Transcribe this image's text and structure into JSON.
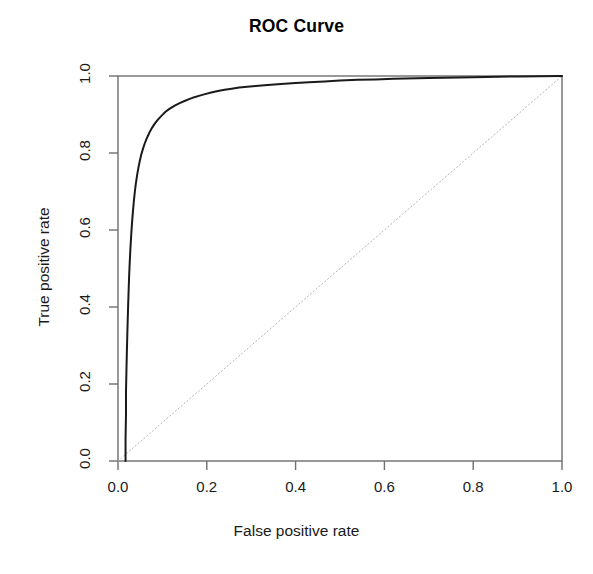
{
  "chart_data": {
    "type": "line",
    "title": "ROC Curve",
    "xlabel": "False positive rate",
    "ylabel": "True positive rate",
    "xlim": [
      0.0,
      1.0
    ],
    "ylim": [
      0.0,
      1.0
    ],
    "grid": false,
    "legend": "none",
    "xticks": [
      "0.0",
      "0.2",
      "0.4",
      "0.6",
      "0.8",
      "1.0"
    ],
    "xtick_values": [
      0.0,
      0.2,
      0.4,
      0.6,
      0.8,
      1.0
    ],
    "yticks": [
      "0.0",
      "0.2",
      "0.4",
      "0.6",
      "0.8",
      "1.0"
    ],
    "ytick_values": [
      0.0,
      0.2,
      0.4,
      0.6,
      0.8,
      1.0
    ],
    "series": [
      {
        "name": "ROC curve",
        "color": "#1a1a1a",
        "style": "solid",
        "width": 2,
        "x": [
          0.017,
          0.017,
          0.018,
          0.018,
          0.019,
          0.02,
          0.021,
          0.022,
          0.023,
          0.024,
          0.025,
          0.026,
          0.027,
          0.028,
          0.03,
          0.032,
          0.034,
          0.036,
          0.038,
          0.04,
          0.043,
          0.046,
          0.049,
          0.052,
          0.056,
          0.06,
          0.064,
          0.068,
          0.072,
          0.077,
          0.082,
          0.088,
          0.094,
          0.1,
          0.107,
          0.115,
          0.123,
          0.131,
          0.14,
          0.15,
          0.16,
          0.172,
          0.184,
          0.196,
          0.21,
          0.225,
          0.24,
          0.256,
          0.273,
          0.291,
          0.31,
          0.33,
          0.352,
          0.375,
          0.4,
          0.43,
          0.465,
          0.5,
          0.54,
          0.58,
          0.62,
          0.7,
          0.8,
          0.9,
          1.0
        ],
        "y": [
          0.0,
          0.06,
          0.12,
          0.18,
          0.235,
          0.285,
          0.33,
          0.372,
          0.41,
          0.445,
          0.478,
          0.505,
          0.53,
          0.553,
          0.592,
          0.625,
          0.653,
          0.678,
          0.7,
          0.719,
          0.742,
          0.762,
          0.779,
          0.794,
          0.81,
          0.824,
          0.836,
          0.846,
          0.856,
          0.866,
          0.875,
          0.884,
          0.892,
          0.899,
          0.907,
          0.914,
          0.92,
          0.925,
          0.93,
          0.935,
          0.94,
          0.945,
          0.949,
          0.953,
          0.957,
          0.961,
          0.964,
          0.967,
          0.97,
          0.972,
          0.974,
          0.976,
          0.978,
          0.98,
          0.982,
          0.984,
          0.986,
          0.988,
          0.99,
          0.991,
          0.993,
          0.995,
          0.997,
          0.999,
          1.0
        ]
      },
      {
        "name": "chance diagonal",
        "color": "#b4b4b4",
        "style": "dotted",
        "width": 1,
        "x": [
          0.0,
          1.0
        ],
        "y": [
          0.0,
          1.0
        ]
      }
    ]
  },
  "plot": {
    "box_color": "#6e6e6e",
    "tick_color": "#6e6e6e",
    "background": "#ffffff"
  }
}
